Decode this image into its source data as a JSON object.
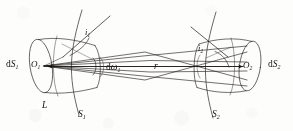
{
  "figure": {
    "type": "optics-geometry-diagram",
    "background_color": "#fdfdfc",
    "ink_color": "#14120f",
    "width": 293,
    "height": 131
  },
  "labels": {
    "dS1": {
      "main": "d",
      "italic": "S",
      "sub": "1"
    },
    "dS2": {
      "main": "d",
      "italic": "S",
      "sub": "2"
    },
    "O1": {
      "italic": "O",
      "sub": "1"
    },
    "O2": {
      "italic": "O",
      "sub": "2"
    },
    "i1": {
      "italic": "i",
      "sub": "1"
    },
    "i2": {
      "italic": "i",
      "sub": "2"
    },
    "domega1": {
      "main": "d",
      "italic": "ω",
      "sub": "1"
    },
    "r": {
      "italic": "r"
    },
    "L": {
      "italic": "L"
    },
    "S1": {
      "italic": "S",
      "sub": "1"
    },
    "S2": {
      "italic": "S",
      "sub": "2"
    }
  },
  "geometry": {
    "left_element": {
      "name": "dS1",
      "center_label": "O1",
      "apex_point": [
        41,
        66
      ],
      "ellipse_center": [
        41,
        66
      ],
      "ellipse_rx": 11,
      "ellipse_ry": 27,
      "normal_angle_label": "i1",
      "surface_curve_label": "S1",
      "radiance_label": "L"
    },
    "right_element": {
      "name": "dS2",
      "center_label": "O2",
      "apex_point": [
        249,
        66
      ],
      "ellipse_center": [
        249,
        66
      ],
      "ellipse_rx": 11,
      "ellipse_ry": 25,
      "normal_angle_label": "i2",
      "surface_curve_label": "S2"
    },
    "separation_label": "r",
    "solid_angle_label": "domega1"
  }
}
